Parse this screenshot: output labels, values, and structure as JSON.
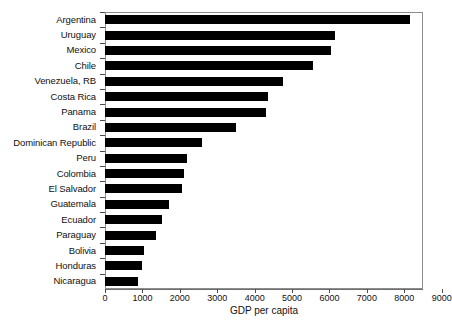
{
  "chart_data": {
    "type": "bar",
    "orientation": "horizontal",
    "title": "",
    "xlabel": "GDP per capita",
    "ylabel": "",
    "xlim": [
      0,
      8500
    ],
    "xticks": [
      0,
      1000,
      2000,
      3000,
      4000,
      5000,
      6000,
      7000,
      8000,
      9000
    ],
    "xticklabels": [
      "0",
      "1000",
      "2000",
      "3000",
      "4000",
      "5000",
      "6000",
      "7000",
      "8000",
      "9000"
    ],
    "grid": false,
    "legend": null,
    "bar_color": "#000000",
    "categories": [
      "Argentina",
      "Uruguay",
      "Mexico",
      "Chile",
      "Venezuela, RB",
      "Costa Rica",
      "Panama",
      "Brazil",
      "Dominican Republic",
      "Peru",
      "Colombia",
      "El Salvador",
      "Guatemala",
      "Ecuador",
      "Paraguay",
      "Bolivia",
      "Honduras",
      "Nicaragua"
    ],
    "values": [
      8150,
      6150,
      6050,
      5550,
      4750,
      4350,
      4300,
      3500,
      2580,
      2200,
      2100,
      2050,
      1700,
      1520,
      1350,
      1050,
      980,
      870
    ]
  }
}
